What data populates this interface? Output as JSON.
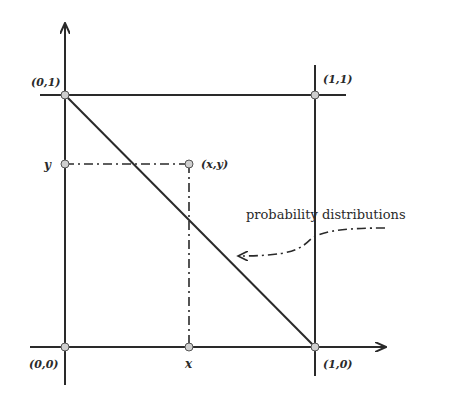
{
  "diagram": {
    "corner_labels": {
      "top_left": "(0,1)",
      "top_right": "(1,1)",
      "bottom_left": "(0,0)",
      "bottom_right": "(1,0)"
    },
    "point_label": "(x,y)",
    "x_label": "x",
    "y_label": "y",
    "annotation": "probability distributions",
    "colors": {
      "line": "#2a2a2a",
      "marker_fill": "#cfcfcf",
      "background": "#ffffff"
    }
  }
}
